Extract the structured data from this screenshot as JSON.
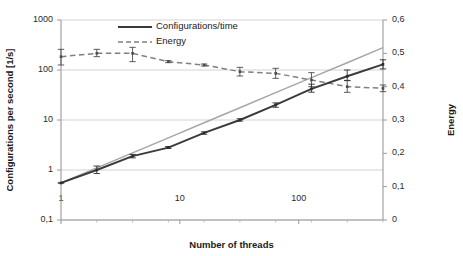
{
  "chart_data": {
    "type": "line",
    "title": "",
    "xlabel": "Number of threads",
    "ylabel": "Configurations per second [1/s]",
    "ylabel_secondary": "Energy",
    "x_scale": "log",
    "y_scale": "log",
    "y_secondary_scale": "linear",
    "xlim": [
      1,
      512
    ],
    "ylim": [
      0.1,
      1000
    ],
    "ylim_secondary": [
      0,
      0.6
    ],
    "grid": "horizontal",
    "legend_position": "top-center",
    "x_tick_labels": [
      "1",
      "10",
      "100"
    ],
    "x_tick_values": [
      1,
      10,
      100
    ],
    "y_tick_labels": [
      "0,1",
      "1",
      "10",
      "100",
      "1000"
    ],
    "y_tick_values": [
      0.1,
      1,
      10,
      100,
      1000
    ],
    "y_secondary_tick_labels": [
      "0",
      "0,1",
      "0,2",
      "0,3",
      "0,4",
      "0,5",
      "0,6"
    ],
    "y_secondary_tick_values": [
      0,
      0.1,
      0.2,
      0.3,
      0.4,
      0.5,
      0.6
    ],
    "x": [
      1,
      2,
      4,
      8,
      16,
      32,
      64,
      128,
      256,
      512
    ],
    "series": [
      {
        "name": "Configurations/time",
        "axis": "left",
        "style": "solid",
        "color": "#3a3a3a",
        "values": [
          0.55,
          1.0,
          1.9,
          2.8,
          5.5,
          10.0,
          20.0,
          42.0,
          75.0,
          130.0
        ],
        "error_low": [
          0.55,
          0.85,
          1.75,
          2.7,
          5.2,
          9.5,
          18.0,
          36.0,
          62.0,
          105.0
        ],
        "error_high": [
          0.55,
          1.2,
          2.05,
          2.95,
          5.8,
          10.6,
          22.0,
          52.0,
          100.0,
          160.0
        ]
      },
      {
        "name": "Energy",
        "axis": "right",
        "style": "dashed",
        "color": "#808080",
        "values": [
          0.49,
          0.5,
          0.5,
          0.475,
          0.465,
          0.445,
          0.44,
          0.42,
          0.4,
          0.395
        ],
        "error_low": [
          0.465,
          0.49,
          0.475,
          0.472,
          0.462,
          0.432,
          0.425,
          0.4,
          0.383,
          0.385
        ],
        "error_high": [
          0.512,
          0.512,
          0.518,
          0.478,
          0.468,
          0.458,
          0.455,
          0.442,
          0.418,
          0.405
        ]
      },
      {
        "name": "ideal-reference",
        "axis": "left",
        "style": "solid-light",
        "color": "#a6a6a6",
        "values": [
          0.55,
          1.1,
          2.2,
          4.4,
          8.8,
          17.6,
          35.2,
          70.4,
          140.0,
          280.0
        ],
        "show_in_legend": false
      }
    ],
    "legend": [
      {
        "label": "Configurations/time",
        "style": "solid",
        "color": "#3a3a3a"
      },
      {
        "label": "Energy",
        "style": "dashed",
        "color": "#808080"
      }
    ]
  }
}
